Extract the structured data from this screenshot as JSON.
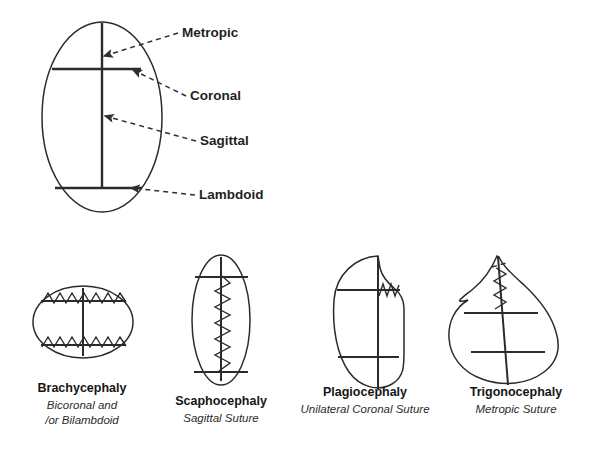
{
  "figure": {
    "title_visible": false,
    "background_color": "#ffffff",
    "ink_color": "#2b2b2b"
  },
  "top_diagram": {
    "name": "normal-skull-suture-map",
    "view": "superior view of infant skull",
    "shape": "ellipse",
    "labels": [
      {
        "id": "metopic",
        "text": "Metropic",
        "x": 182,
        "y": 37,
        "points_to": "anterior midline suture",
        "arrow_from_x": 178,
        "arrow_from_y": 33,
        "arrow_to_x": 104,
        "arrow_to_y": 56
      },
      {
        "id": "coronal",
        "text": "Coronal",
        "x": 190,
        "y": 100,
        "points_to": "upper transverse suture",
        "arrow_from_x": 186,
        "arrow_from_y": 96,
        "arrow_to_x": 133,
        "arrow_to_y": 70
      },
      {
        "id": "sagittal",
        "text": "Sagittal",
        "x": 200,
        "y": 145,
        "points_to": "midline longitudinal suture",
        "arrow_from_x": 196,
        "arrow_from_y": 141,
        "arrow_to_x": 105,
        "arrow_to_y": 116
      },
      {
        "id": "lambdoid",
        "text": "Lambdoid",
        "x": 199,
        "y": 199,
        "points_to": "lower transverse suture",
        "arrow_from_x": 195,
        "arrow_from_y": 195,
        "arrow_to_x": 131,
        "arrow_to_y": 188
      }
    ],
    "geometry": {
      "ellipse_cx": 102,
      "ellipse_cy": 117,
      "ellipse_rx": 60,
      "ellipse_ry": 95,
      "sagittal_x": 102,
      "sagittal_y1": 23,
      "sagittal_y2": 189,
      "coronal_y": 69,
      "coronal_x1": 52,
      "coronal_x2": 141,
      "lambdoid_y": 188,
      "lambdoid_x1": 55,
      "lambdoid_x2": 142
    }
  },
  "bottom_row": {
    "name": "craniosynostosis-types",
    "count": 4,
    "items": [
      {
        "id": "brachycephaly",
        "title": "Brachycephaly",
        "subtitle_lines": [
          "Bicoronal and",
          "/or Bilambdoid"
        ],
        "fused_sutures": "bicoronal and/or bilambdoid",
        "head_shape": "wide short ellipse",
        "title_x": 82,
        "title_y": 392,
        "sub_x": 82,
        "sub_y1": 409,
        "sub_y2": 424
      },
      {
        "id": "scaphocephaly",
        "title": "Scaphocephaly",
        "subtitle_lines": [
          "Sagittal Suture"
        ],
        "fused_sutures": "sagittal",
        "head_shape": "long narrow ellipse",
        "title_x": 221,
        "title_y": 405,
        "sub_x": 221,
        "sub_y1": 422,
        "sub_y2": null
      },
      {
        "id": "plagiocephaly",
        "title": "Plagiocephaly",
        "subtitle_lines": [
          "Unilateral Coronal Suture"
        ],
        "fused_sutures": "unilateral coronal",
        "head_shape": "asymmetric oblique oval",
        "title_x": 365,
        "title_y": 396,
        "sub_x": 365,
        "sub_y1": 413,
        "sub_y2": null
      },
      {
        "id": "trigonocephaly",
        "title": "Trigonocephaly",
        "subtitle_lines": [
          "Metropic Suture"
        ],
        "fused_sutures": "metopic",
        "head_shape": "triangular pointed anterior",
        "title_x": 516,
        "title_y": 396,
        "sub_x": 516,
        "sub_y1": 413,
        "sub_y2": null
      }
    ]
  }
}
